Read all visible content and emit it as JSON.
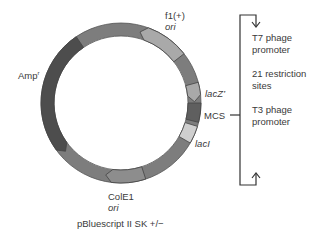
{
  "title": "pBluescript II SK +/−",
  "features": [
    {
      "id": "f1-ori",
      "name": "f1(+)",
      "sub": "ori",
      "color": "#a9a9a9",
      "start": -75,
      "end": -38,
      "arrow": "ccw"
    },
    {
      "id": "lacz",
      "name": "lacZ’",
      "color": "#a9a9a9",
      "start": -15,
      "end": -1,
      "arrow": "cw"
    },
    {
      "id": "mcs",
      "name": "MCS",
      "color": "#5f5f5f",
      "start": 0,
      "end": 14
    },
    {
      "id": "laci",
      "name": "lacI",
      "color": "#cfcfcf",
      "start": 17,
      "end": 30
    },
    {
      "id": "cole1-ori",
      "name": "ColE1",
      "sub": "ori",
      "color": "#8d8d8d",
      "start": 72,
      "end": 102,
      "arrow": "cw"
    },
    {
      "id": "ampr",
      "name": "Amp",
      "sup": "r",
      "color": "#4d4d4d",
      "start": 139,
      "end": 236,
      "arrow": "ccw"
    }
  ],
  "backbone_color": "#7d7d7d",
  "mcs_detail": {
    "label": "MCS",
    "items": [
      "T7 phage",
      "promoter",
      "21 restriction",
      "sites",
      "T3 phage",
      "promoter"
    ]
  },
  "labels": {
    "f1": "f1(+)",
    "f1_ori": "ori",
    "amp": "Amp",
    "amp_sup": "r",
    "lacz": "lacZ’",
    "mcs": "MCS",
    "laci": "lacI",
    "cole1": "ColE1",
    "cole1_ori": "ori"
  }
}
